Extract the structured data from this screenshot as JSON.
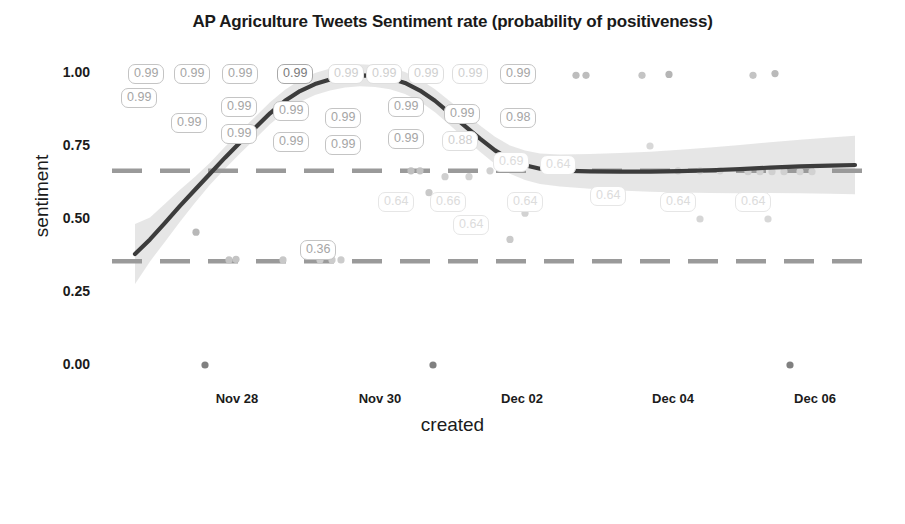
{
  "chart_data": {
    "type": "scatter",
    "title": "AP Agriculture Tweets Sentiment rate (probability of positiveness)",
    "xlabel": "created",
    "ylabel": "sentiment",
    "ylim": [
      0.0,
      1.0
    ],
    "ytick_labels": [
      "0.00",
      "0.25",
      "0.50",
      "0.75",
      "1.00"
    ],
    "ytick_values": [
      0.0,
      0.25,
      0.5,
      0.75,
      1.0
    ],
    "xtick_labels": [
      "Nov 28",
      "Nov 30",
      "Dec 02",
      "Dec 04",
      "Dec 06"
    ],
    "grid": false,
    "legend": {
      "title": "sentiment",
      "position": "bottom",
      "type": "continuous-colorbar",
      "ticks": [
        "0",
        "0.2",
        "0.5",
        "0.8",
        "1"
      ],
      "tick_values": [
        0,
        0.2,
        0.5,
        0.8,
        1
      ],
      "gradient_start_color": "#6e6e6e",
      "gradient_end_color": "#c8c8c8"
    },
    "reference_lines": [
      {
        "name": "upper-threshold",
        "y": 0.665,
        "style": "dashed",
        "color": "#9a9a9a"
      },
      {
        "name": "lower-threshold",
        "y": 0.355,
        "style": "dashed",
        "color": "#9a9a9a"
      }
    ],
    "smooth_line": {
      "name": "loess-trend",
      "color": "#3c3c3c",
      "confidence_band_color": "#dddddd",
      "points": [
        [
          135,
          0.38
        ],
        [
          150,
          0.43
        ],
        [
          165,
          0.487
        ],
        [
          180,
          0.545
        ],
        [
          195,
          0.6
        ],
        [
          210,
          0.655
        ],
        [
          225,
          0.71
        ],
        [
          240,
          0.762
        ],
        [
          255,
          0.812
        ],
        [
          270,
          0.862
        ],
        [
          285,
          0.905
        ],
        [
          300,
          0.938
        ],
        [
          315,
          0.962
        ],
        [
          330,
          0.978
        ],
        [
          345,
          0.988
        ],
        [
          360,
          0.992
        ],
        [
          375,
          0.99
        ],
        [
          390,
          0.982
        ],
        [
          405,
          0.966
        ],
        [
          420,
          0.94
        ],
        [
          435,
          0.905
        ],
        [
          450,
          0.862
        ],
        [
          465,
          0.818
        ],
        [
          480,
          0.775
        ],
        [
          495,
          0.735
        ],
        [
          510,
          0.703
        ],
        [
          525,
          0.684
        ],
        [
          540,
          0.672
        ],
        [
          560,
          0.666
        ],
        [
          590,
          0.663
        ],
        [
          620,
          0.662
        ],
        [
          650,
          0.662
        ],
        [
          680,
          0.664
        ],
        [
          710,
          0.667
        ],
        [
          740,
          0.671
        ],
        [
          770,
          0.676
        ],
        [
          800,
          0.68
        ],
        [
          830,
          0.683
        ],
        [
          855,
          0.685
        ]
      ]
    },
    "points": [
      {
        "x": 205,
        "y": 0.0,
        "color": "#808080"
      },
      {
        "x": 433,
        "y": 0.0,
        "color": "#808080"
      },
      {
        "x": 790,
        "y": 0.0,
        "color": "#808080"
      },
      {
        "x": 196,
        "y": 0.455,
        "color": "#b8b8b8"
      },
      {
        "x": 229,
        "y": 0.36,
        "color": "#c4c4c4"
      },
      {
        "x": 236,
        "y": 0.362,
        "color": "#c4c4c4"
      },
      {
        "x": 283,
        "y": 0.36,
        "color": "#c8c8c8"
      },
      {
        "x": 320,
        "y": 0.36,
        "color": "#cccccc"
      },
      {
        "x": 332,
        "y": 0.36,
        "color": "#cccccc"
      },
      {
        "x": 341,
        "y": 0.36,
        "color": "#cccccc"
      },
      {
        "x": 411,
        "y": 0.665,
        "color": "#bfbfbf"
      },
      {
        "x": 420,
        "y": 0.665,
        "color": "#c2c2c2"
      },
      {
        "x": 429,
        "y": 0.59,
        "color": "#c9c9c9"
      },
      {
        "x": 445,
        "y": 0.645,
        "color": "#cfcfcf"
      },
      {
        "x": 458,
        "y": 0.49,
        "color": "#cccccc"
      },
      {
        "x": 469,
        "y": 0.645,
        "color": "#d2d2d2"
      },
      {
        "x": 490,
        "y": 0.665,
        "color": "#d0d0d0"
      },
      {
        "x": 510,
        "y": 0.43,
        "color": "#cacaca"
      },
      {
        "x": 525,
        "y": 0.52,
        "color": "#d2d2d2"
      },
      {
        "x": 576,
        "y": 0.992,
        "color": "#bdbdbd"
      },
      {
        "x": 586,
        "y": 0.992,
        "color": "#bdbdbd"
      },
      {
        "x": 642,
        "y": 0.992,
        "color": "#c4c4c4"
      },
      {
        "x": 669,
        "y": 0.995,
        "color": "#b5b5b5"
      },
      {
        "x": 753,
        "y": 0.992,
        "color": "#c4c4c4"
      },
      {
        "x": 775,
        "y": 0.998,
        "color": "#bababa"
      },
      {
        "x": 650,
        "y": 0.75,
        "color": "#d8d8d8"
      },
      {
        "x": 678,
        "y": 0.665,
        "color": "#cfcfcf"
      },
      {
        "x": 700,
        "y": 0.665,
        "color": "#d2d2d2"
      },
      {
        "x": 720,
        "y": 0.665,
        "color": "#d2d2d2"
      },
      {
        "x": 748,
        "y": 0.662,
        "color": "#cfcfcf"
      },
      {
        "x": 760,
        "y": 0.662,
        "color": "#d0d0d0"
      },
      {
        "x": 772,
        "y": 0.662,
        "color": "#d0d0d0"
      },
      {
        "x": 784,
        "y": 0.662,
        "color": "#d0d0d0"
      },
      {
        "x": 800,
        "y": 0.662,
        "color": "#d2d2d2"
      },
      {
        "x": 812,
        "y": 0.662,
        "color": "#d2d2d2"
      },
      {
        "x": 700,
        "y": 0.5,
        "color": "#d6d6d6"
      },
      {
        "x": 768,
        "y": 0.5,
        "color": "#d8d8d8"
      }
    ],
    "data_labels": [
      {
        "text": "0.99",
        "x": 121,
        "y": 88,
        "shade": "mid"
      },
      {
        "text": "0.99",
        "x": 128,
        "y": 64,
        "shade": "mid"
      },
      {
        "text": "0.99",
        "x": 174,
        "y": 64,
        "shade": "mid"
      },
      {
        "text": "0.99",
        "x": 171,
        "y": 113,
        "shade": "mid"
      },
      {
        "text": "0.99",
        "x": 222,
        "y": 64,
        "shade": "mid"
      },
      {
        "text": "0.99",
        "x": 221,
        "y": 97,
        "shade": "mid"
      },
      {
        "text": "0.99",
        "x": 221,
        "y": 124,
        "shade": "mid"
      },
      {
        "text": "0.99",
        "x": 277,
        "y": 64,
        "shade": "dark"
      },
      {
        "text": "0.99",
        "x": 273,
        "y": 101,
        "shade": "mid"
      },
      {
        "text": "0.99",
        "x": 273,
        "y": 132,
        "shade": "mid"
      },
      {
        "text": "0.99",
        "x": 328,
        "y": 64,
        "shade": "pale"
      },
      {
        "text": "0.99",
        "x": 325,
        "y": 108,
        "shade": "mid"
      },
      {
        "text": "0.99",
        "x": 325,
        "y": 135,
        "shade": "mid"
      },
      {
        "text": "0.99",
        "x": 366,
        "y": 64,
        "shade": "pale"
      },
      {
        "text": "0.99",
        "x": 388,
        "y": 97,
        "shade": "mid"
      },
      {
        "text": "0.99",
        "x": 388,
        "y": 129,
        "shade": "mid"
      },
      {
        "text": "0.99",
        "x": 408,
        "y": 64,
        "shade": "pale"
      },
      {
        "text": "0.99",
        "x": 452,
        "y": 64,
        "shade": "pale"
      },
      {
        "text": "0.99",
        "x": 444,
        "y": 104,
        "shade": "mid"
      },
      {
        "text": "0.88",
        "x": 442,
        "y": 131,
        "shade": "pale"
      },
      {
        "text": "0.99",
        "x": 500,
        "y": 64,
        "shade": "mid"
      },
      {
        "text": "0.98",
        "x": 500,
        "y": 108,
        "shade": "mid"
      },
      {
        "text": "0.69",
        "x": 493,
        "y": 152,
        "shade": "palest"
      },
      {
        "text": "0.64",
        "x": 540,
        "y": 155,
        "shade": "palest"
      },
      {
        "text": "0.36",
        "x": 300,
        "y": 240,
        "shade": "mid"
      },
      {
        "text": "0.64",
        "x": 378,
        "y": 192,
        "shade": "palest"
      },
      {
        "text": "0.64",
        "x": 453,
        "y": 215,
        "shade": "palest"
      },
      {
        "text": "0.66",
        "x": 430,
        "y": 192,
        "shade": "palest"
      },
      {
        "text": "0.64",
        "x": 507,
        "y": 192,
        "shade": "palest"
      },
      {
        "text": "0.64",
        "x": 590,
        "y": 186,
        "shade": "palest"
      },
      {
        "text": "0.64",
        "x": 660,
        "y": 192,
        "shade": "palest"
      },
      {
        "text": "0.64",
        "x": 735,
        "y": 192,
        "shade": "palest"
      }
    ]
  }
}
